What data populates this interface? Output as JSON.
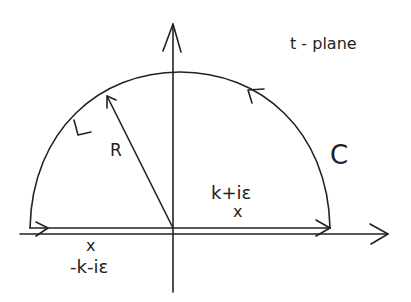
{
  "diagram": {
    "plane_label": "t - plane",
    "contour_label": "C",
    "radius_label": "R",
    "pole_upper": {
      "label": "k+iε",
      "marker": "x"
    },
    "pole_lower": {
      "label": "-k-iε",
      "marker": "x"
    },
    "stroke_color": "#222222",
    "background": "#ffffff"
  }
}
